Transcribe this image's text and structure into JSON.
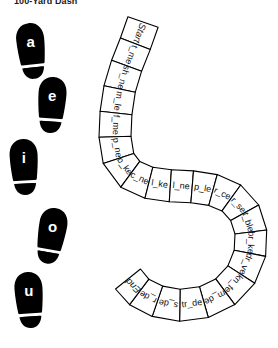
{
  "worksheet": {
    "title": "100-Yard Dash",
    "ink_color": "#000000",
    "paper_color": "#ffffff"
  },
  "footprints": {
    "label": "vowel footprints",
    "items": [
      {
        "vowel": "a",
        "x": 31,
        "y": 47,
        "rotation": -6
      },
      {
        "vowel": "e",
        "x": 52,
        "y": 101,
        "rotation": 4
      },
      {
        "vowel": "i",
        "x": 24,
        "y": 163,
        "rotation": -3
      },
      {
        "vowel": "o",
        "x": 52,
        "y": 232,
        "rotation": 10
      },
      {
        "vowel": "u",
        "x": 29,
        "y": 296,
        "rotation": -4
      }
    ]
  },
  "track": {
    "label": "race track path",
    "start_label": "Start",
    "end_label": "End",
    "cells": [
      {
        "text": "Start",
        "cx": 140,
        "cy": 27,
        "rotation": -27
      },
      {
        "text": "t_me",
        "cx": 130,
        "cy": 50,
        "rotation": -20
      },
      {
        "text": "sh_ne",
        "cx": 122,
        "cy": 72,
        "rotation": -14
      },
      {
        "text": "m_le",
        "cx": 116,
        "cy": 94,
        "rotation": -8
      },
      {
        "text": "f_me",
        "cx": 113,
        "cy": 117,
        "rotation": -2
      },
      {
        "text": "p_ne",
        "cx": 113,
        "cy": 139,
        "rotation": 6
      },
      {
        "text": "b_ke",
        "cx": 118,
        "cy": 160,
        "rotation": 24
      },
      {
        "text": "c_ne",
        "cx": 131,
        "cy": 177,
        "rotation": 56
      },
      {
        "text": "l_ke",
        "cx": 151,
        "cy": 186,
        "rotation": 78
      },
      {
        "text": "l_ne",
        "cx": 172,
        "cy": 189,
        "rotation": 83
      },
      {
        "text": "p_le",
        "cx": 193,
        "cy": 190,
        "rotation": 85
      },
      {
        "text": "r_ce",
        "cx": 213,
        "cy": 193,
        "rotation": 80
      },
      {
        "text": "r_se",
        "cx": 231,
        "cy": 200,
        "rotation": 68
      },
      {
        "text": "t_ble",
        "cx": 245,
        "cy": 214,
        "rotation": 46
      },
      {
        "text": "br_ke",
        "cx": 252,
        "cy": 238,
        "rotation": 8
      },
      {
        "text": "dr_ve",
        "cx": 250,
        "cy": 263,
        "rotation": -14
      },
      {
        "text": "kn_fe",
        "cx": 238,
        "cy": 286,
        "rotation": -44
      },
      {
        "text": "m_de",
        "cx": 219,
        "cy": 303,
        "rotation": -72
      },
      {
        "text": "tr_de",
        "cx": 196,
        "cy": 311,
        "rotation": -86
      },
      {
        "text": "s_de",
        "cx": 173,
        "cy": 311,
        "rotation": -99
      },
      {
        "text": "r_de",
        "cx": 150,
        "cy": 303,
        "rotation": -115
      },
      {
        "text": "End",
        "cx": 132,
        "cy": 287,
        "rotation": -140
      }
    ]
  }
}
